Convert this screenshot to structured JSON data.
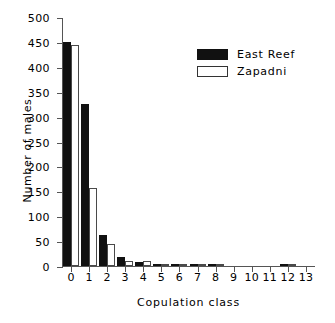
{
  "chart_data": {
    "type": "bar",
    "title": "",
    "xlabel": "Copulation class",
    "ylabel": "Number of males",
    "categories": [
      "0",
      "1",
      "2",
      "3",
      "4",
      "5",
      "6",
      "7",
      "8",
      "9",
      "10",
      "11",
      "12",
      "13"
    ],
    "series": [
      {
        "name": "East Reef",
        "color": "#111111",
        "values": [
          450,
          325,
          62,
          19,
          8,
          2,
          1,
          1,
          1,
          0,
          0,
          0,
          4,
          0
        ]
      },
      {
        "name": "Zapadni",
        "color": "#ffffff",
        "values": [
          443,
          157,
          45,
          11,
          10,
          3,
          2,
          2,
          1,
          0,
          0,
          0,
          1,
          0
        ]
      }
    ],
    "ylim": [
      0,
      500
    ],
    "y_ticks": [
      0,
      50,
      100,
      150,
      200,
      250,
      300,
      350,
      400,
      450,
      500
    ],
    "y_tick_labels": [
      "0",
      "50",
      "100",
      "150",
      "200",
      "250",
      "300",
      "350",
      "400",
      "450",
      "500"
    ],
    "grid": false,
    "legend_position": "upper right"
  },
  "legend": {
    "entries": [
      {
        "label": "East Reef"
      },
      {
        "label": "Zapadni"
      }
    ]
  },
  "axes": {
    "x_title": "Copulation class",
    "y_title": "Number of males"
  }
}
